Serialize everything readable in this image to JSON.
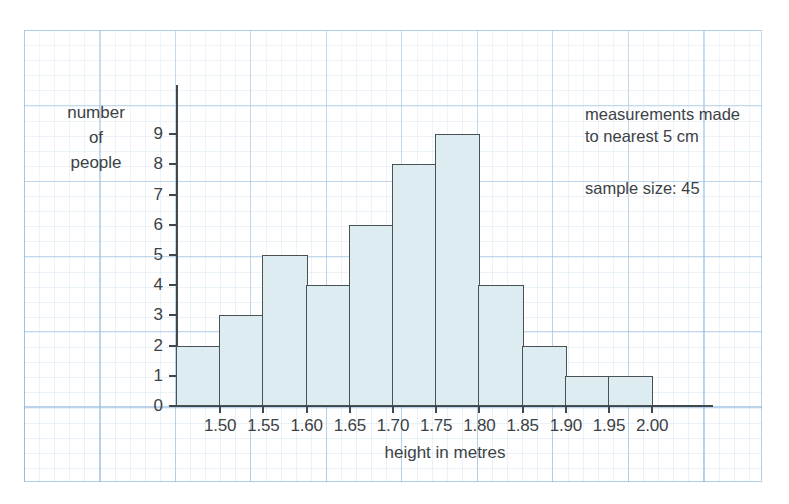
{
  "chart_data": {
    "type": "bar",
    "title": "",
    "subtitle": "",
    "xlabel": "height in metres",
    "ylabel": "number of people",
    "ylabel_lines": [
      "number",
      "of",
      "people"
    ],
    "categories": [
      "1.45-1.50",
      "1.50-1.55",
      "1.55-1.60",
      "1.60-1.65",
      "1.65-1.70",
      "1.70-1.75",
      "1.75-1.80",
      "1.80-1.85",
      "1.85-1.90",
      "1.90-1.95",
      "1.95-2.00"
    ],
    "bin_edges": [
      1.45,
      1.5,
      1.55,
      1.6,
      1.65,
      1.7,
      1.75,
      1.8,
      1.85,
      1.9,
      1.95,
      2.0
    ],
    "values": [
      2,
      3,
      5,
      4,
      6,
      8,
      9,
      4,
      2,
      1,
      1
    ],
    "bin_width": 0.05,
    "xlim": [
      1.45,
      2.05
    ],
    "ylim": [
      0,
      9.5
    ],
    "xticks": [
      1.5,
      1.55,
      1.6,
      1.65,
      1.7,
      1.75,
      1.8,
      1.85,
      1.9,
      1.95,
      2.0
    ],
    "xtick_labels": [
      "1.50",
      "1.55",
      "1.60",
      "1.65",
      "1.70",
      "1.75",
      "1.80",
      "1.85",
      "1.90",
      "1.95",
      "2.00"
    ],
    "yticks": [
      0,
      1,
      2,
      3,
      4,
      5,
      6,
      7,
      8,
      9
    ],
    "ytick_labels": [
      "0",
      "1",
      "2",
      "3",
      "4",
      "5",
      "6",
      "7",
      "8",
      "9"
    ],
    "grid": true,
    "grid_style": "graph-paper",
    "legend": false,
    "annotations": [
      "measurements made to nearest 5 cm",
      "sample size: 45"
    ],
    "bar_fill_color": "#dcecf0",
    "bar_edge_color": "#4a5155",
    "grid_color": "#78aad7",
    "text_color": "#3c4245",
    "sample_size": 45
  },
  "notes": {
    "measurement": "measurements made\nto nearest 5 cm",
    "measurement_line1": "measurements made",
    "measurement_line2": "to nearest 5 cm",
    "sample": "sample size: 45"
  }
}
